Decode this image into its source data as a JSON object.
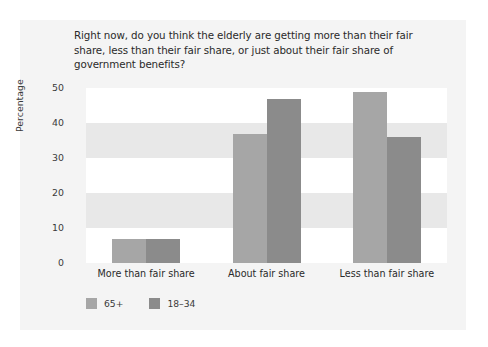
{
  "chart_data": {
    "type": "bar",
    "title": "Right now, do you think the elderly are getting more than their fair share, less than their fair share, or just about their fair share of government benefits?",
    "xlabel": "",
    "ylabel": "Percentage",
    "categories": [
      "More than fair share",
      "About fair share",
      "Less than fair share"
    ],
    "series": [
      {
        "name": "65+",
        "values": [
          7,
          37,
          49
        ],
        "color": "#a6a6a6"
      },
      {
        "name": "18–34",
        "values": [
          7,
          47,
          36
        ],
        "color": "#8b8b8b"
      }
    ],
    "ylim": [
      0,
      50
    ],
    "yticks": [
      0,
      10,
      20,
      30,
      40,
      50
    ],
    "grid": false,
    "banding": true,
    "legend_position": "bottom-left"
  },
  "figure": {
    "background": "#f4f4f4",
    "plot_background": "#ffffff",
    "band_color": "#e8e8e8"
  }
}
